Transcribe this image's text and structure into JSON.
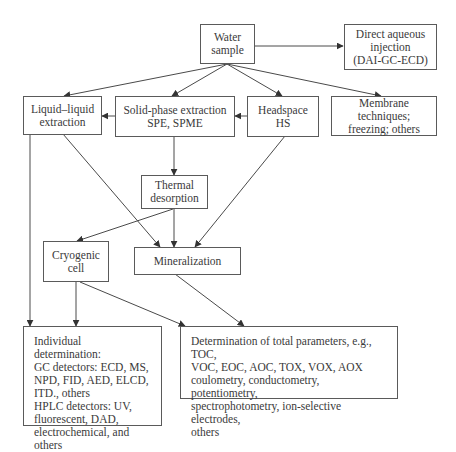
{
  "diagram": {
    "nodes": {
      "water": {
        "label": "Water\nsample"
      },
      "direct": {
        "label": "Direct aqueous\ninjection\n(DAI-GC-ECD)"
      },
      "lle": {
        "label": "Liquid–liquid\nextraction"
      },
      "spe": {
        "label": "Solid-phase extraction\nSPE, SPME"
      },
      "headspace": {
        "label": "Headspace\nHS"
      },
      "membrane": {
        "label": "Membrane techniques;\nfreezing; others"
      },
      "thermal": {
        "label": "Thermal\ndesorption"
      },
      "cryogenic": {
        "label": "Cryogenic\ncell"
      },
      "mineralization": {
        "label": "Mineralization"
      },
      "individual": {
        "label": "Individual determination:\nGC detectors: ECD, MS,\nNPD, FID, AED, ELCD,\nITD., others\nHPLC detectors: UV,\nfluorescent, DAD,\nelectrochemical, and others"
      },
      "total": {
        "label": "Determination of total parameters, e.g., TOC,\nVOC, EOC, AOC, TOX, VOX, AOX\ncoulometry, conductometry, potentiometry,\nspectrophotometry, ion-selective electrodes,\nothers"
      }
    },
    "edges": [
      {
        "from": "water",
        "to": "direct"
      },
      {
        "from": "water",
        "to": "lle"
      },
      {
        "from": "water",
        "to": "spe"
      },
      {
        "from": "water",
        "to": "headspace"
      },
      {
        "from": "water",
        "to": "membrane"
      },
      {
        "from": "spe",
        "to": "lle"
      },
      {
        "from": "headspace",
        "to": "spe"
      },
      {
        "from": "spe",
        "to": "thermal"
      },
      {
        "from": "lle",
        "to": "mineralization"
      },
      {
        "from": "headspace",
        "to": "mineralization"
      },
      {
        "from": "thermal",
        "to": "mineralization"
      },
      {
        "from": "thermal",
        "to": "cryogenic"
      },
      {
        "from": "lle",
        "to": "individual"
      },
      {
        "from": "cryogenic",
        "to": "individual"
      },
      {
        "from": "cryogenic",
        "to": "total"
      },
      {
        "from": "mineralization",
        "to": "total"
      }
    ]
  },
  "colors": {
    "line": "#4a4a4a",
    "border": "#5a5a5a",
    "text": "#3a3a3a"
  }
}
